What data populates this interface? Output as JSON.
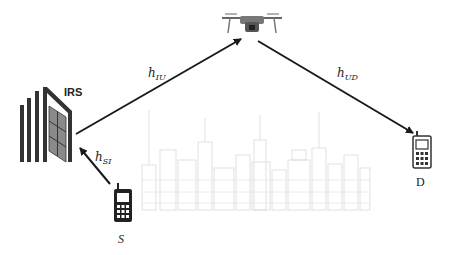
{
  "diagram": {
    "nodes": {
      "irs": {
        "label": "IRS"
      },
      "uav": {
        "label": ""
      },
      "source": {
        "label": "S"
      },
      "destination": {
        "label": "D"
      }
    },
    "links": [
      {
        "from": "S",
        "to": "IRS",
        "label": "h",
        "sub": "SI"
      },
      {
        "from": "IRS",
        "to": "UAV",
        "label": "h",
        "sub": "IU"
      },
      {
        "from": "UAV",
        "to": "D",
        "label": "h",
        "sub": "UD"
      }
    ],
    "colors": {
      "line": "#1a1a1a",
      "skyline": "#d6d6d6",
      "building": "#333333",
      "panel": "#7a7a7a"
    }
  }
}
